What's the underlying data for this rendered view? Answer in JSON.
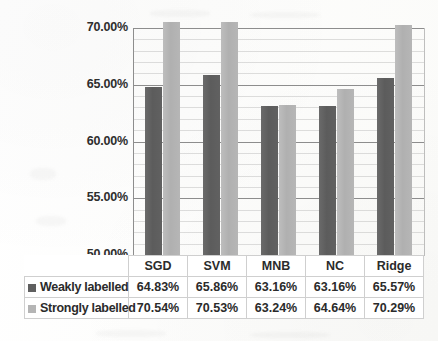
{
  "chart_data": {
    "type": "bar",
    "title": "",
    "subtitle": "",
    "xlabel": "",
    "ylabel": "",
    "categories": [
      "SGD",
      "SVM",
      "MNB",
      "NC",
      "Ridge"
    ],
    "series": [
      {
        "name": "Weakly labelled",
        "color": "#5f5f5f",
        "values": [
          64.83,
          65.86,
          63.16,
          63.16,
          65.57
        ],
        "labels": [
          "64.83%",
          "65.86%",
          "63.16%",
          "63.16%",
          "65.57%"
        ]
      },
      {
        "name": "Strongly labelled",
        "color": "#b5b5b5",
        "values": [
          70.54,
          70.53,
          63.24,
          64.64,
          70.29
        ],
        "labels": [
          "70.54%",
          "70.53%",
          "63.24%",
          "64.64%",
          "70.29%"
        ]
      }
    ],
    "ylim": [
      50,
      70
    ],
    "ytick_values": [
      50,
      55,
      60,
      65,
      70
    ],
    "ytick_labels": [
      "50.00%",
      "55.00%",
      "60.00%",
      "65.00%",
      "70.00%"
    ],
    "grid": true,
    "legend_position": "data-table-below",
    "value_suffix": "%"
  },
  "table": {
    "row_header_blank": "",
    "category_headers": [
      "SGD",
      "SVM",
      "MNB",
      "NC",
      "Ridge"
    ],
    "rows": [
      {
        "legend_label": "Weakly labelled",
        "swatch": "weak-series-swatch",
        "cells": [
          "64.83%",
          "65.86%",
          "63.16%",
          "63.16%",
          "65.57%"
        ]
      },
      {
        "legend_label": "Strongly labelled",
        "swatch": "strong-series-swatch",
        "cells": [
          "70.54%",
          "70.53%",
          "63.24%",
          "64.64%",
          "70.29%"
        ]
      }
    ]
  }
}
